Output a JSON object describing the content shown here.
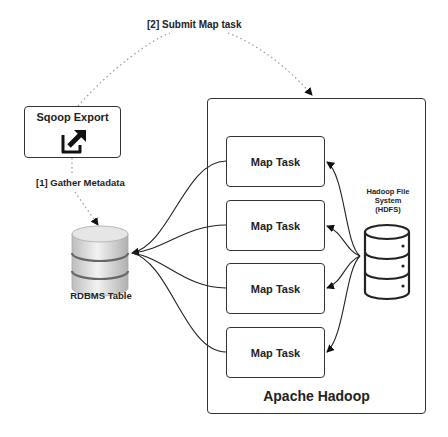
{
  "diagram": {
    "steps": {
      "submit": "[2] Submit Map task",
      "gather": "[1] Gather Metadata"
    },
    "sqoop": {
      "label": "Sqoop Export",
      "icon": "external-link-icon"
    },
    "rdbms": {
      "label": "RDBMS Table",
      "icon": "database-icon"
    },
    "hadoop": {
      "label": "Apache Hadoop",
      "hdfs": {
        "label_line1": "Hadoop File",
        "label_line2": "System",
        "label_line3": "(HDFS)",
        "icon": "database-server-icon"
      },
      "map_tasks": [
        {
          "label": "Map Task"
        },
        {
          "label": "Map Task"
        },
        {
          "label": "Map Task"
        },
        {
          "label": "Map Task"
        }
      ]
    },
    "colors": {
      "stroke": "#333333",
      "text": "#222222",
      "background": "#ffffff"
    }
  }
}
